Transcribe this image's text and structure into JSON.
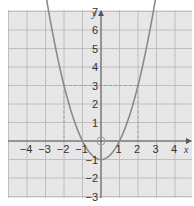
{
  "chart_data": {
    "type": "line",
    "title": "",
    "function": "y = x^2 - 1",
    "xlabel": "x",
    "ylabel": "y",
    "xlim": [
      -4.5,
      4.5
    ],
    "ylim": [
      -4,
      8.5
    ],
    "grid": true,
    "x_ticks": [
      -4,
      -3,
      -2,
      -1,
      1,
      2,
      3,
      4
    ],
    "y_ticks": [
      8,
      7,
      6,
      5,
      4,
      3,
      2,
      1,
      -1,
      -2,
      -3
    ],
    "x": [
      -3,
      -2,
      -1,
      0,
      1,
      2,
      3
    ],
    "values": [
      8,
      3,
      0,
      -1,
      0,
      3,
      8
    ],
    "annotations": [
      {
        "type": "dashed-horizontal",
        "y": 3,
        "from_x": -2,
        "to_x": 2
      },
      {
        "type": "dashed-vertical",
        "x": -2,
        "from_y": 3,
        "to_y": 0
      },
      {
        "type": "dashed-vertical",
        "x": 2,
        "from_y": 3,
        "to_y": 0
      },
      {
        "type": "open-circle",
        "x": 0,
        "y": 0
      }
    ],
    "colors": {
      "curve": "#8a8a8a",
      "grid": "#b8b8b8",
      "background": "#e6e6e6",
      "axis": "#555555"
    }
  },
  "labels": {
    "x_axis": "x",
    "y_axis": "y",
    "x_ticks": [
      "−4",
      "−3",
      "−2",
      "−1",
      "1",
      "2",
      "3",
      "4"
    ],
    "y_ticks": [
      "8",
      "7",
      "6",
      "5",
      "4",
      "3",
      "2",
      "1",
      "−1",
      "−2",
      "−3"
    ]
  }
}
